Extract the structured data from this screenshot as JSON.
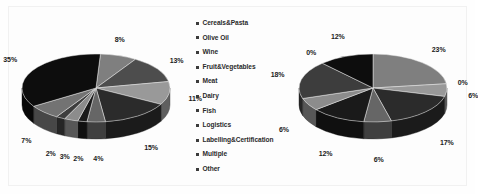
{
  "legend": {
    "marker_color": "#3b3b3b",
    "items": [
      {
        "label": "Cereals&Pasta",
        "color": "#7f7f7f"
      },
      {
        "label": "Olive Oil",
        "color": "#4d4d4d"
      },
      {
        "label": "Wine",
        "color": "#999999"
      },
      {
        "label": "Fruit&Vegetables",
        "color": "#2b2b2b"
      },
      {
        "label": "Meat",
        "color": "#666666"
      },
      {
        "label": "Dairy",
        "color": "#1a1a1a"
      },
      {
        "label": "Fish",
        "color": "#8c8c8c"
      },
      {
        "label": "Logistics",
        "color": "#3d3d3d"
      },
      {
        "label": "Labelling&Certification",
        "color": "#737373"
      },
      {
        "label": "Multiple",
        "color": "#0d0d0d"
      },
      {
        "label": "Other",
        "color": "#595959"
      }
    ]
  },
  "chart_data": [
    {
      "type": "pie",
      "name": "left-pie",
      "title": "",
      "three_d": true,
      "legend_position": "center",
      "categories": [
        "Cereals&Pasta",
        "Olive Oil",
        "Wine",
        "Fruit&Vegetables",
        "Meat",
        "Dairy",
        "Fish",
        "Logistics",
        "Labelling&Certification",
        "Multiple",
        "Other"
      ],
      "values": [
        8,
        13,
        11,
        15,
        4,
        2,
        3,
        2,
        7,
        35,
        0
      ],
      "labels": [
        "8%",
        "13%",
        "11%",
        "15%",
        "4%",
        "2%",
        "3%",
        "2%",
        "7%",
        "35%",
        ""
      ],
      "colors": [
        "#7f7f7f",
        "#4d4d4d",
        "#999999",
        "#2b2b2b",
        "#666666",
        "#1a1a1a",
        "#8c8c8c",
        "#3d3d3d",
        "#737373",
        "#0d0d0d",
        "#595959"
      ]
    },
    {
      "type": "pie",
      "name": "right-pie",
      "title": "",
      "three_d": true,
      "legend_position": "center",
      "categories": [
        "Cereals&Pasta",
        "Olive Oil",
        "Wine",
        "Fruit&Vegetables",
        "Meat",
        "Dairy",
        "Fish",
        "Logistics",
        "Labelling&Certification",
        "Multiple",
        "Other"
      ],
      "values": [
        23,
        0,
        6,
        17,
        6,
        12,
        6,
        18,
        0,
        12,
        0
      ],
      "labels": [
        "23%",
        "0%",
        "6%",
        "17%",
        "6%",
        "12%",
        "6%",
        "18%",
        "0%",
        "12%",
        ""
      ],
      "colors": [
        "#7f7f7f",
        "#4d4d4d",
        "#999999",
        "#2b2b2b",
        "#666666",
        "#1a1a1a",
        "#8c8c8c",
        "#3d3d3d",
        "#737373",
        "#0d0d0d",
        "#595959"
      ]
    }
  ]
}
